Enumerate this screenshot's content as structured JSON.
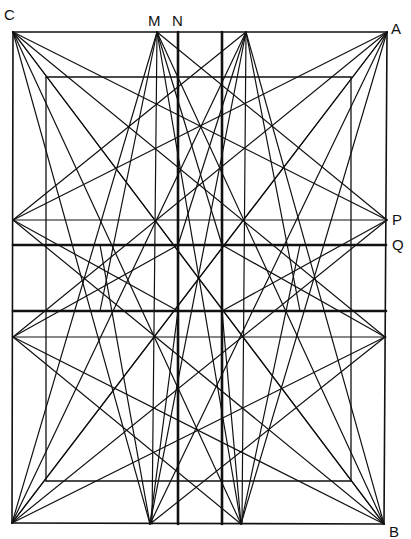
{
  "labels": {
    "C": "C",
    "M": "M",
    "N": "N",
    "A": "A",
    "P": "P",
    "Q": "Q",
    "B": "B"
  },
  "colors": {
    "background": "#ffffff",
    "stroke": "#111111"
  },
  "points": {
    "C": [
      13,
      32
    ],
    "A": [
      387,
      32
    ],
    "B": [
      384,
      524
    ],
    "D": [
      12,
      523
    ],
    "M": [
      157,
      32
    ],
    "T2": [
      246,
      32
    ],
    "BL": [
      150,
      524
    ],
    "BR": [
      241,
      524
    ],
    "LP": [
      13,
      220
    ],
    "LQ": [
      13,
      337
    ],
    "RP": [
      387,
      220
    ],
    "RQ": [
      385,
      337
    ],
    "centerTop": [
      200,
      124
    ],
    "centerMid": [
      200,
      278
    ],
    "centerBot": [
      197,
      432
    ]
  },
  "inner_rect": {
    "x1": 46,
    "y1": 77,
    "x2": 351,
    "y2": 481
  },
  "thick_verticals": [
    178,
    222
  ],
  "thick_horizontals": [
    245,
    311
  ],
  "thin_horizontals": [
    220,
    337
  ],
  "thin_verticals": [
    157,
    246
  ]
}
